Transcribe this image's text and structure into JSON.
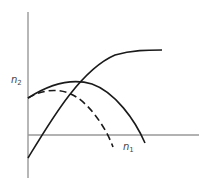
{
  "diagram": {
    "axes": {
      "y_label": "n",
      "y_label_sub": "2",
      "x_label": "n",
      "x_label_sub": "1",
      "axis_color": "#999999"
    },
    "curves": [
      {
        "name": "rising-saturating-curve",
        "style": "solid",
        "color": "#1a1a1a"
      },
      {
        "name": "hump-curve",
        "style": "solid",
        "color": "#1a1a1a"
      },
      {
        "name": "dashed-hump-curve",
        "style": "dashed",
        "color": "#1a1a1a"
      }
    ]
  }
}
